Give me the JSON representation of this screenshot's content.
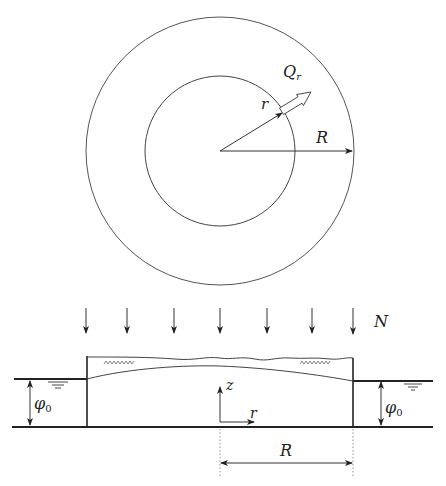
{
  "figure": {
    "plan_view": {
      "outer_circle_label": "R",
      "inner_radius_label": "r",
      "flux_label_main": "Q",
      "flux_label_sub": "r"
    },
    "cross_section": {
      "recharge_label": "N",
      "left_head_label_main": "φ",
      "left_head_label_sub": "0",
      "right_head_label_main": "φ",
      "right_head_label_sub": "0",
      "vertical_axis_label": "z",
      "radial_axis_label": "r",
      "radius_dimension_label": "R"
    },
    "colors": {
      "line": "#333333",
      "thin_line": "#555555",
      "background": "#ffffff"
    }
  }
}
